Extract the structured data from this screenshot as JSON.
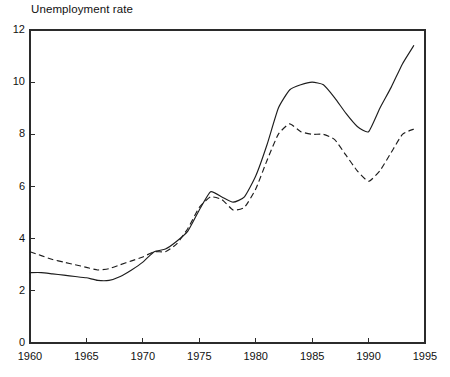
{
  "chart_data": {
    "type": "line",
    "title": "Unemployment rate",
    "xlabel": "",
    "ylabel": "",
    "xlim": [
      1960,
      1995
    ],
    "ylim": [
      0,
      12
    ],
    "grid": false,
    "legend": "none",
    "xticks": [
      1960,
      1965,
      1970,
      1975,
      1980,
      1985,
      1990,
      1995
    ],
    "xtick_labels": [
      "1960",
      "1965",
      "1970",
      "1975",
      "1980",
      "1985",
      "1990",
      "1995"
    ],
    "yticks": [
      0,
      2,
      4,
      6,
      8,
      10,
      12
    ],
    "ytick_labels": [
      "0",
      "2",
      "4",
      "6",
      "8",
      "10",
      "12"
    ],
    "x": [
      1960,
      1961,
      1962,
      1963,
      1964,
      1965,
      1966,
      1967,
      1968,
      1969,
      1970,
      1971,
      1972,
      1973,
      1974,
      1975,
      1976,
      1977,
      1978,
      1979,
      1980,
      1981,
      1982,
      1983,
      1984,
      1985,
      1986,
      1987,
      1988,
      1989,
      1990,
      1991,
      1992,
      1993,
      1994
    ],
    "series": [
      {
        "name": "solid-series",
        "style": "solid",
        "color": "#1d1d1d",
        "values": [
          2.7,
          2.7,
          2.65,
          2.6,
          2.55,
          2.5,
          2.4,
          2.4,
          2.55,
          2.8,
          3.1,
          3.5,
          3.6,
          3.9,
          4.3,
          5.1,
          5.8,
          5.6,
          5.4,
          5.6,
          6.4,
          7.6,
          9.0,
          9.7,
          9.9,
          10.0,
          9.9,
          9.4,
          8.8,
          8.3,
          8.1,
          9.0,
          9.8,
          10.7,
          11.4
        ]
      },
      {
        "name": "dashed-series",
        "style": "dashed",
        "color": "#1d1d1d",
        "values": [
          3.5,
          3.35,
          3.2,
          3.1,
          3.0,
          2.9,
          2.8,
          2.85,
          3.0,
          3.15,
          3.3,
          3.5,
          3.5,
          3.8,
          4.4,
          5.2,
          5.6,
          5.5,
          5.1,
          5.2,
          5.9,
          7.0,
          8.0,
          8.4,
          8.1,
          8.0,
          8.0,
          7.8,
          7.2,
          6.6,
          6.2,
          6.6,
          7.3,
          8.0,
          8.2
        ]
      }
    ],
    "axis_color": "#2b2b2b",
    "background": "#ffffff"
  },
  "figure": {
    "plot_area": {
      "left_px": 30,
      "right_px": 425,
      "top_px": 30,
      "bottom_px": 343
    }
  }
}
